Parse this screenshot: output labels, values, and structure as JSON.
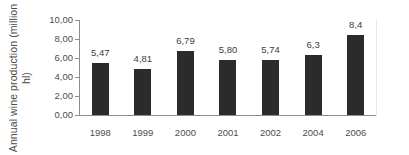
{
  "chart_data": {
    "type": "bar",
    "title": "",
    "subtitle": "",
    "xlabel": "",
    "ylabel_lines": [
      "Annual wine production (million",
      "hl)"
    ],
    "ylabel": "Annual wine production (million hl)",
    "categories": [
      "1998",
      "1999",
      "2000",
      "2001",
      "2002",
      "2004",
      "2006"
    ],
    "values": [
      5.47,
      4.81,
      6.79,
      5.8,
      5.74,
      6.3,
      8.4
    ],
    "data_labels": [
      "5,47",
      "4,81",
      "6,79",
      "5,80",
      "5,74",
      "6,3",
      "8,4"
    ],
    "ylim": [
      0,
      10
    ],
    "ytick_values": [
      0,
      2,
      4,
      6,
      8,
      10
    ],
    "ytick_labels": [
      "0,00",
      "2,00",
      "4,00",
      "6,00",
      "8,00",
      "10,00"
    ],
    "grid": false,
    "legend": null,
    "legend_position": "none",
    "bar_color": "#2b2b2b",
    "axis_color": "#8d8d8d",
    "text_color": "#4d4d4d",
    "decimal_separator": ","
  }
}
